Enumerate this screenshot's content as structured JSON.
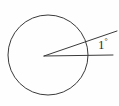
{
  "figure": {
    "type": "geometry-diagram",
    "canvas": {
      "width": 119,
      "height": 106,
      "background": "#fefefe"
    },
    "stroke_color": "#3a3a3a",
    "text_color": "#2e2e2e",
    "circle": {
      "center_x": 48,
      "center_y": 55,
      "radius": 40,
      "stroke_width": 1
    },
    "vertex": {
      "x": 44,
      "y": 56
    },
    "rays": [
      {
        "name": "lower-ray",
        "x1": 44,
        "y1": 56,
        "x2": 113,
        "y2": 55,
        "stroke_width": 1
      },
      {
        "name": "upper-ray",
        "x1": 44,
        "y1": 56,
        "x2": 117,
        "y2": 31,
        "stroke_width": 1
      }
    ],
    "labels": [
      {
        "name": "angle-measure",
        "value": "1",
        "unit": "°",
        "x": 98,
        "y": 38
      }
    ]
  }
}
